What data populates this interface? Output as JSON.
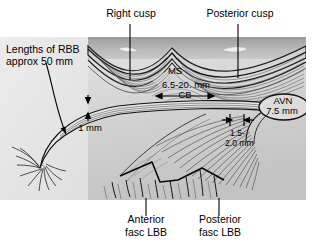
{
  "figure": {
    "type": "anatomical-diagram",
    "colors": {
      "paper": "#ffffff",
      "artwork_light": "#d9d9d9",
      "artwork_mid": "#c6c6c6",
      "artwork_dark": "#9a9a9a",
      "ink": "#1a1a1a",
      "leader": "#000000"
    }
  },
  "callouts": {
    "right_cusp": "Right cusp",
    "posterior_cusp": "Posterior cusp",
    "rbb_length_line1": "Lengths of RBB",
    "rbb_length_line2": "approx 50 mm",
    "anterior_fasc_line1": "Anterior",
    "anterior_fasc_line2": "fasc LBB",
    "posterior_fasc_line1": "Posterior",
    "posterior_fasc_line2": "fasc LBB"
  },
  "inner_labels": {
    "ms": "MS",
    "cb_measure": "6.5-20. mm",
    "cb": "CB",
    "avn": "AVN",
    "avn_measure": "7.5 mm",
    "one_mm": "1 mm",
    "gap_measure_line1": "1.5-",
    "gap_measure_line2": "2.0 mm"
  },
  "measurements": [
    {
      "name": "RBB length",
      "value": "approx 50 mm"
    },
    {
      "name": "CB (common bundle) length",
      "value": "6.5-20. mm"
    },
    {
      "name": "AVN to CB",
      "value": "7.5 mm"
    },
    {
      "name": "RBB thickness",
      "value": "1 mm"
    },
    {
      "name": "AVN gap",
      "value": "1.5-2.0 mm"
    }
  ],
  "abbreviations": [
    {
      "short": "RBB",
      "meaning": "right bundle branch"
    },
    {
      "short": "MS",
      "meaning": "membranous septum"
    },
    {
      "short": "CB",
      "meaning": "common bundle"
    },
    {
      "short": "AVN",
      "meaning": "atrioventricular node"
    },
    {
      "short": "LBB",
      "meaning": "left bundle branch"
    }
  ]
}
